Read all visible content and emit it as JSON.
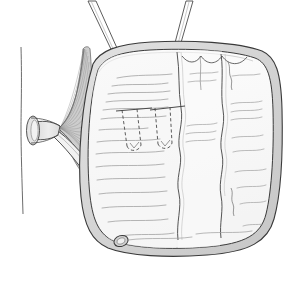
{
  "figure": {
    "title": "Surgical line drawing: bowel pouch with mesentery and afferent limb",
    "type": "medical-line-art",
    "canvas": {
      "width": 292,
      "height": 282,
      "background": "#ffffff"
    },
    "colors": {
      "outline": "#3a3a3a",
      "wall_fill": "#d8d8d8",
      "lumen_fill": "#fbfbfb",
      "panel_fill": "#f7f7f7",
      "texture_line": "#9a9a9a",
      "mesentery_fill": "#cfcfcf",
      "mesentery_line": "#8d8d8d",
      "suture_line": "#5a5a5a",
      "instrument_fill": "#ffffff"
    },
    "parts": [
      {
        "id": "pouch-body",
        "label": "Bowel pouch body"
      },
      {
        "id": "pouch-wall",
        "label": "Serosal wall rim"
      },
      {
        "id": "mesentery-fan",
        "label": "Mesenteric fan"
      },
      {
        "id": "proximal-stump",
        "label": "Open proximal bowel stump"
      },
      {
        "id": "afferent-limb",
        "label": "Afferent limb tube"
      },
      {
        "id": "limb-anastomosis",
        "label": "Anastomosis ostium"
      },
      {
        "id": "retractor-left",
        "label": "Left retractor instrument"
      },
      {
        "id": "retractor-right",
        "label": "Right retractor instrument"
      },
      {
        "id": "suture-left",
        "label": "Left stay suture"
      },
      {
        "id": "suture-right",
        "label": "Right stay suture"
      },
      {
        "id": "fold-a",
        "label": "Haustral fold line A"
      },
      {
        "id": "fold-b",
        "label": "Haustral fold line B"
      },
      {
        "id": "fold-c",
        "label": "Haustral fold line C"
      },
      {
        "id": "vertical-line",
        "label": "Background reference line"
      }
    ],
    "annotations": []
  }
}
